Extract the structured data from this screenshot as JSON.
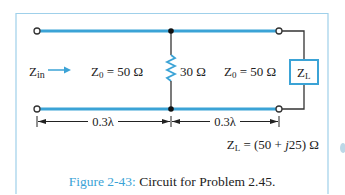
{
  "colors": {
    "line_blue": "#3ba3d6",
    "frame_blue": "#9fd0ea",
    "wire_dark": "#333333",
    "text": "#222222"
  },
  "circuit": {
    "input_label": "Z",
    "input_sub": "in",
    "line1": {
      "z_label": "Z",
      "z_sub": "0",
      "z_value": " = 50 Ω",
      "length": "0.3λ"
    },
    "shunt_resistor": {
      "value": "30 Ω"
    },
    "line2": {
      "z_label": "Z",
      "z_sub": "0",
      "z_value": " = 50 Ω",
      "length": "0.3λ"
    },
    "load": {
      "box_label": "Z",
      "box_sub": "L",
      "eq_label": "Z",
      "eq_sub": "L",
      "eq_prefix": " = (50 + ",
      "eq_j": "j",
      "eq_suffix": "25) Ω"
    }
  },
  "caption": {
    "figure_label": "Figure 2-43:",
    "text": " Circuit for Problem 2.45."
  }
}
